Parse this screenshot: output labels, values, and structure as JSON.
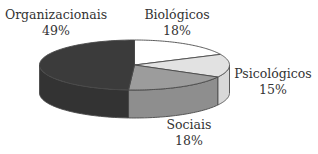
{
  "chart_data": {
    "type": "pie",
    "style": "3d",
    "title": "",
    "start": "top",
    "direction": "clockwise",
    "slices": [
      {
        "label": "Biológicos",
        "value": 18,
        "value_label": "18%",
        "color": "#ffffff",
        "side_color": "#f2f2f2"
      },
      {
        "label": "Psicológicos",
        "value": 15,
        "value_label": "15%",
        "color": "#e2e2e2",
        "side_color": "#d8d8d8"
      },
      {
        "label": "Sociais",
        "value": 18,
        "value_label": "18%",
        "color": "#9c9c9c",
        "side_color": "#8e8e8e"
      },
      {
        "label": "Organizacionais",
        "value": 49,
        "value_label": "49%",
        "color": "#3b3b3b",
        "side_color": "#333333"
      }
    ],
    "outline_color": "#4a4a4a",
    "legend": "none"
  }
}
